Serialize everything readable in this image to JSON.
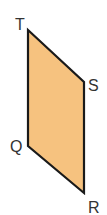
{
  "diagram": {
    "shape": "parallelogram",
    "fill_color": "#F6C27F",
    "stroke_color": "#1a1a1a",
    "vertices": [
      {
        "name": "T",
        "x": 28,
        "y": 30
      },
      {
        "name": "S",
        "x": 84,
        "y": 82
      },
      {
        "name": "R",
        "x": 84,
        "y": 193
      },
      {
        "name": "Q",
        "x": 28,
        "y": 146
      }
    ],
    "labels": {
      "T": "T",
      "S": "S",
      "R": "R",
      "Q": "Q"
    }
  }
}
